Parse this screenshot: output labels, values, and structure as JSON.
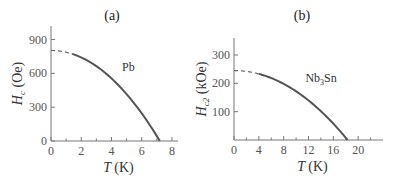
{
  "chart_data": [
    {
      "type": "line",
      "title": "(a)",
      "xlabel": "T (K)",
      "xlabel_italic": "T",
      "xlabel_unit": "(K)",
      "ylabel_symbol": "H",
      "ylabel_sub": "c",
      "ylabel_unit": "(Oe)",
      "xlim": [
        0,
        8.4
      ],
      "ylim": [
        0,
        1020
      ],
      "xticks": [
        0,
        2,
        4,
        6,
        8
      ],
      "xminor": [
        1,
        3,
        5,
        7
      ],
      "yticks": [
        0,
        300,
        600,
        900
      ],
      "annotation": "Pb",
      "annotation_pos": [
        4.7,
        620
      ],
      "Tc": 7.2,
      "H0": 803,
      "dashed_range": [
        0,
        1.4
      ],
      "solid_range": [
        1.4,
        7.2
      ],
      "series": [
        {
          "name": "Pb",
          "x": [
            0,
            1,
            1.4,
            2,
            3,
            4,
            5,
            6,
            6.5,
            7,
            7.2
          ],
          "y": [
            803,
            788,
            773,
            741,
            668,
            554,
            409,
            245,
            154,
            57,
            0
          ]
        }
      ]
    },
    {
      "type": "line",
      "title": "(b)",
      "xlabel": "T (K)",
      "xlabel_italic": "T",
      "xlabel_unit": "(K)",
      "ylabel_symbol": "H",
      "ylabel_sub": "c2",
      "ylabel_unit": "(kOe)",
      "xlim": [
        0,
        24
      ],
      "ylim": [
        0,
        360
      ],
      "xticks": [
        0,
        4,
        8,
        12,
        16,
        20
      ],
      "xminor": [
        2,
        6,
        10,
        14,
        18,
        22
      ],
      "yticks": [
        100,
        200,
        300
      ],
      "yticks_labels": [
        "100",
        "200",
        "300"
      ],
      "x_tick_labels": [
        "0",
        "4",
        "8",
        "12",
        "16",
        "20"
      ],
      "annotation_base": "Nb",
      "annotation_sub": "3",
      "annotation_tail": "Sn",
      "annotation_pos": [
        11.5,
        205
      ],
      "Tc": 18.3,
      "H0": 245,
      "dashed_range": [
        0,
        4
      ],
      "solid_range": [
        4,
        18.3
      ],
      "series": [
        {
          "name": "Nb3Sn",
          "x": [
            0,
            2,
            4,
            6,
            8,
            10,
            12,
            14,
            16,
            17,
            18.3
          ],
          "y": [
            245,
            241,
            234,
            222,
            204,
            178,
            150,
            115,
            76,
            54,
            0
          ]
        }
      ]
    }
  ]
}
